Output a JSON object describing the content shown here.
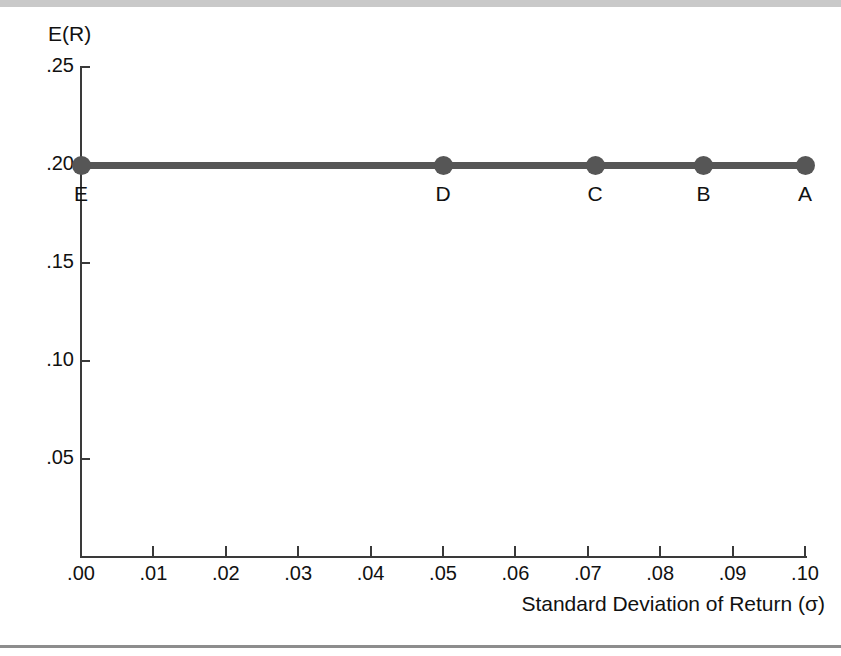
{
  "chart_data": {
    "type": "scatter",
    "title": "",
    "xlabel": "Standard Deviation of Return (σ)",
    "ylabel": "E(R)",
    "xlim": [
      0.0,
      0.1
    ],
    "ylim": [
      0.0,
      0.25
    ],
    "grid": false,
    "legend": "none",
    "x_ticks": [
      {
        "value": 0.0,
        "label": ".00"
      },
      {
        "value": 0.01,
        "label": ".01"
      },
      {
        "value": 0.02,
        "label": ".02"
      },
      {
        "value": 0.03,
        "label": ".03"
      },
      {
        "value": 0.04,
        "label": ".04"
      },
      {
        "value": 0.05,
        "label": ".05"
      },
      {
        "value": 0.06,
        "label": ".06"
      },
      {
        "value": 0.07,
        "label": ".07"
      },
      {
        "value": 0.08,
        "label": ".08"
      },
      {
        "value": 0.09,
        "label": ".09"
      },
      {
        "value": 0.1,
        "label": ".10"
      }
    ],
    "y_ticks": [
      {
        "value": 0.25,
        "label": ".25"
      },
      {
        "value": 0.2,
        "label": ".20"
      },
      {
        "value": 0.15,
        "label": ".15"
      },
      {
        "value": 0.1,
        "label": ".10"
      },
      {
        "value": 0.05,
        "label": ".05"
      }
    ],
    "series": [
      {
        "name": "portfolios",
        "color": "#565656",
        "points": [
          {
            "label": "E",
            "x": 0.0,
            "y": 0.2
          },
          {
            "label": "D",
            "x": 0.05,
            "y": 0.2
          },
          {
            "label": "C",
            "x": 0.071,
            "y": 0.2
          },
          {
            "label": "B",
            "x": 0.086,
            "y": 0.2
          },
          {
            "label": "A",
            "x": 0.1,
            "y": 0.2
          }
        ]
      }
    ]
  },
  "colors": {
    "series": "#565656",
    "axis": "#3a3a3a",
    "text": "#111111",
    "top_band": "#c9c9c9",
    "bottom_rule": "#8d8d8d"
  }
}
